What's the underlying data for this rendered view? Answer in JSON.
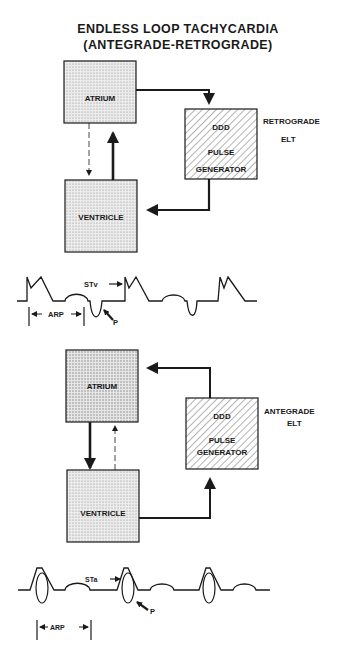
{
  "title": {
    "line1": "ENDLESS LOOP TACHYCARDIA",
    "line2": "(ANTEGRADE-RETROGRADE)"
  },
  "top_panel": {
    "atrium_label": "ATRIUM",
    "ventricle_label": "VENTRICLE",
    "generator": {
      "line1": "DDD",
      "line2": "PULSE",
      "line3": "GENERATOR"
    },
    "side_label": {
      "line1": "RETROGRADE",
      "line2": "ELT"
    },
    "ecg": {
      "st_label": "STv",
      "arp_label": "ARP",
      "p_label": "P"
    }
  },
  "bottom_panel": {
    "atrium_label": "ATRIUM",
    "ventricle_label": "VENTRICLE",
    "generator": {
      "line1": "DDD",
      "line2": "PULSE",
      "line3": "GENERATOR"
    },
    "side_label": {
      "line1": "ANTEGRADE",
      "line2": "ELT"
    },
    "ecg": {
      "st_label": "STa",
      "arp_label": "ARP",
      "p_label": "P"
    }
  }
}
